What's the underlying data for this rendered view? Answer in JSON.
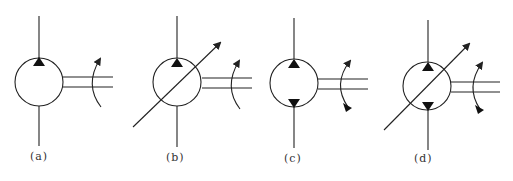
{
  "diagram": {
    "stroke_color": "#222222",
    "background": "#ffffff",
    "symbols": [
      {
        "id": "a",
        "label": "(a)",
        "description": "fixed displacement, unidirectional",
        "variable": false,
        "bidirectional": false,
        "cx": 39,
        "cy": 82,
        "label_x": 30,
        "label_y": 150
      },
      {
        "id": "b",
        "label": "(b)",
        "description": "variable displacement, unidirectional",
        "variable": true,
        "bidirectional": false,
        "cx": 177,
        "cy": 82,
        "label_x": 165,
        "label_y": 152
      },
      {
        "id": "c",
        "label": "(c)",
        "description": "fixed displacement, bidirectional",
        "variable": false,
        "bidirectional": true,
        "cx": 294,
        "cy": 83,
        "label_x": 283,
        "label_y": 153
      },
      {
        "id": "d",
        "label": "(d)",
        "description": "variable displacement, bidirectional",
        "variable": true,
        "bidirectional": true,
        "cx": 427,
        "cy": 86,
        "label_x": 413,
        "label_y": 153
      }
    ]
  }
}
